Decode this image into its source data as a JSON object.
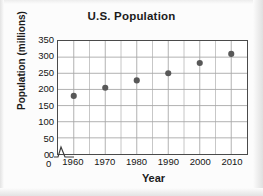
{
  "figure": {
    "title": "U.S. Population",
    "origin_label_y": "0",
    "origin_label_x": "0",
    "axis_break_icon": "axis-break-zigzag"
  },
  "chart_data": {
    "type": "scatter",
    "title": "U.S. Population",
    "xlabel": "Year",
    "ylabel": "Population (millions)",
    "x": [
      1960,
      1970,
      1980,
      1990,
      2000,
      2010
    ],
    "values": [
      180,
      205,
      228,
      250,
      282,
      310
    ],
    "series": [
      {
        "name": "U.S. Population",
        "values": [
          180,
          205,
          228,
          250,
          282,
          310
        ]
      }
    ],
    "xlim": [
      1955,
      2015
    ],
    "ylim": [
      0,
      350
    ],
    "xticks": [
      1960,
      1970,
      1980,
      1990,
      2000,
      2010
    ],
    "xtick_labels": [
      "1960",
      "1970",
      "1980",
      "1990",
      "2000",
      "2010"
    ],
    "yticks": [
      0,
      50,
      100,
      150,
      200,
      250,
      300,
      350
    ],
    "ytick_labels": [
      "0",
      "50",
      "100",
      "150",
      "200",
      "250",
      "300",
      "350"
    ],
    "grid": true,
    "grid_x_step": 5,
    "grid_y_step": 50,
    "legend": false,
    "axis_break_x": true,
    "marker_color": "#585858",
    "grid_color": "#a8a8a8",
    "frame_color": "#4a4a4a"
  }
}
